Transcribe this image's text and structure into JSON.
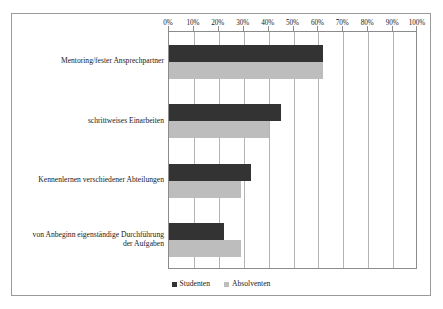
{
  "chart_data": {
    "type": "bar",
    "orientation": "horizontal",
    "title": "",
    "xlabel": "",
    "ylabel": "",
    "xlim": [
      0,
      100
    ],
    "grid": true,
    "grid_axis": "x",
    "legend_position": "bottom-center",
    "axis_position": "top",
    "categories": [
      "Mentoring/fester Ansprechpartner",
      "schrittweises Einarbeiten",
      "Kennenlernen verschiedener Abteilungen",
      "von Anbeginn eigenständige Durchführung\nder Aufgaben"
    ],
    "tick_labels": [
      "0%",
      "10%",
      "20%",
      "30%",
      "40%",
      "50%",
      "60%",
      "70%",
      "80%",
      "90%",
      "100%"
    ],
    "tick_values": [
      0,
      10,
      20,
      30,
      40,
      50,
      60,
      70,
      80,
      90,
      100
    ],
    "series": [
      {
        "name": "Studenten",
        "color": "#333333",
        "values": [
          62,
          45,
          33,
          22
        ]
      },
      {
        "name": "Absolventen",
        "color": "#bdbdbd",
        "values": [
          62,
          40,
          29,
          29
        ]
      }
    ]
  },
  "legend": {
    "entries": [
      {
        "label": "Studenten",
        "color": "#333333"
      },
      {
        "label": "Absolventen",
        "color": "#bdbdbd"
      }
    ]
  },
  "style": {
    "frame_color": "#9a9a9a",
    "axis_color": "#8c8c8c",
    "gridline_color": "#b4b4b4",
    "background": "#ffffff",
    "text_color": "#1a1a1a"
  }
}
